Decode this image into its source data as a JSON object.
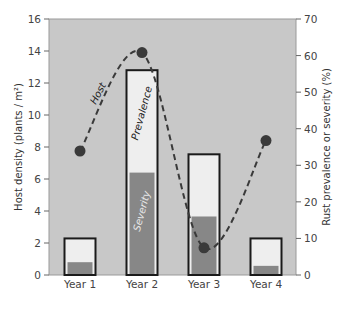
{
  "chart_data": {
    "type": "bar",
    "title": "",
    "categories": [
      "Year 1",
      "Year 2",
      "Year 3",
      "Year 4"
    ],
    "xlabel": "",
    "ylabel": "Host density (plants / m²)",
    "ylabel_right": "Rust prevalence or severity (%)",
    "ylim": [
      0,
      16
    ],
    "ylim_right": [
      0,
      70
    ],
    "yticks": [
      "0",
      "2",
      "4",
      "6",
      "8",
      "10",
      "12",
      "14",
      "16"
    ],
    "yticks_right": [
      "0",
      "10",
      "20",
      "30",
      "40",
      "50",
      "60",
      "70"
    ],
    "grid": false,
    "series": [
      {
        "name": "Prevalence",
        "type": "bar",
        "axis": "right",
        "values": [
          10,
          56,
          33,
          10
        ]
      },
      {
        "name": "Severity",
        "type": "bar",
        "axis": "right",
        "values": [
          3.5,
          28,
          16,
          2.5
        ]
      },
      {
        "name": "Host",
        "type": "line-dashed-with-markers",
        "axis": "left",
        "values": [
          7.75,
          13.9,
          1.7,
          8.4
        ]
      }
    ],
    "annotations": [
      "Host",
      "Prevalence",
      "Severity"
    ],
    "legend": "none"
  },
  "colors": {
    "plot_background": "#c8c8c8",
    "prevalence_fill": "#eeeeee",
    "severity_fill": "#878787",
    "bar_outline": "#1a1a1a",
    "host_line": "#3a3a3a",
    "host_marker": "#3a3a3a"
  }
}
